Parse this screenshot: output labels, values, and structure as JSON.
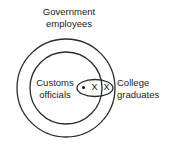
{
  "diagram": {
    "type": "euler-venn",
    "background": "#ffffff",
    "stroke_color": "#222222",
    "labels": {
      "government": {
        "line1": "Government",
        "line2": "employees"
      },
      "customs": {
        "line1": "Customs",
        "line2": "officials"
      },
      "college": {
        "line1": "College",
        "line2": "graduates"
      }
    },
    "marks": {
      "dot": "•",
      "x1": "X",
      "x2": "X"
    },
    "shapes": {
      "outer_circle": {
        "name": "government-employees-circle",
        "cx": 66,
        "cy": 88,
        "r": 49
      },
      "inner_circle": {
        "name": "customs-officials-circle",
        "cx": 66,
        "cy": 88,
        "r": 36
      },
      "ellipse": {
        "name": "college-graduates-ellipse",
        "cx": 95,
        "cy": 88,
        "rx": 18,
        "ry": 8.5
      }
    }
  }
}
